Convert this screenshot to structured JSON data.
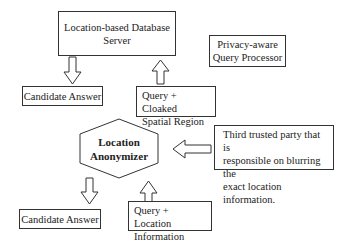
{
  "nodes": {
    "server": {
      "label_line1": "Location-based Database",
      "label_line2": "Server"
    },
    "processor": {
      "label_line1": "Privacy-aware",
      "label_line2": "Query Processor"
    },
    "candidate_top": {
      "label": "Candidate Answer"
    },
    "query_cloaked": {
      "label_line1": "Query + Cloaked",
      "label_line2": "Spatial Region"
    },
    "anonymizer": {
      "label_line1": "Location",
      "label_line2": "Anonymizer"
    },
    "third_party": {
      "line1": "Third trusted party that is",
      "line2": "responsible on blurring the",
      "line3": "exact location information."
    },
    "candidate_bottom": {
      "label": "Candidate Answer"
    },
    "query_location": {
      "label_line1": "Query + Location",
      "label_line2": "Information"
    }
  },
  "arrows": [
    {
      "from": "server",
      "to": "candidate_top",
      "direction": "down"
    },
    {
      "from": "query_cloaked",
      "to": "server",
      "direction": "up"
    },
    {
      "from": "third_party",
      "to": "anonymizer",
      "direction": "left"
    },
    {
      "from": "anonymizer",
      "to": "candidate_bottom",
      "direction": "down"
    },
    {
      "from": "query_location",
      "to": "anonymizer",
      "direction": "up"
    }
  ]
}
